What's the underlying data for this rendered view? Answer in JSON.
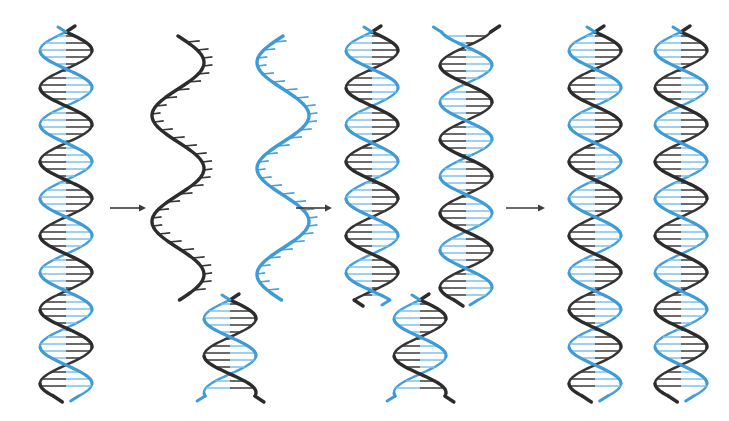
{
  "figure": {
    "background_color": "#ffffff",
    "width": 729,
    "height": 421,
    "colors": {
      "parent_strand_dark": "#2c2c2c",
      "parent_strand_blue": "#3d9bd8",
      "base_pair_dark": "#3a3a3a",
      "base_pair_blue": "#7fc0e8",
      "arrow": "#3a3a3a"
    }
  },
  "stages": [
    {
      "id": "stage-1",
      "label": "Parental DNA double helix",
      "helices": [
        {
          "id": "parent-helix",
          "label": "Parental double helix",
          "center_x": 66,
          "top_y": 32,
          "bottom_y": 396,
          "amplitude": 26,
          "period": 74,
          "phase": 0,
          "paired": true,
          "strand_a_color": "#2c2c2c",
          "strand_b_color": "#3d9bd8"
        }
      ]
    },
    {
      "id": "stage-2",
      "label": "Strands separate; template strands exposed",
      "helices": [
        {
          "id": "template-strand-dark",
          "label": "Dark template strand, unwound",
          "center_x": 178,
          "top_y": 36,
          "bottom_y": 300,
          "amplitude": 26,
          "period": 106,
          "phase": 0,
          "paired": false,
          "strand_a_color": "#2c2c2c",
          "teeth_color": "#3a3a3a",
          "teeth_side": "right"
        },
        {
          "id": "template-strand-blue",
          "label": "Blue template strand, unwound",
          "center_x": 283,
          "top_y": 36,
          "bottom_y": 300,
          "amplitude": 26,
          "period": 106,
          "phase": 3.141592653589793,
          "paired": false,
          "strand_a_color": "#3d9bd8",
          "teeth_color": "#3d9bd8",
          "teeth_side": "right"
        },
        {
          "id": "unreplicated-fork-base",
          "label": "Still-paired parental region below replication fork",
          "center_x": 230,
          "top_y": 300,
          "bottom_y": 396,
          "amplitude": 26,
          "period": 74,
          "phase": 0,
          "paired": true,
          "strand_a_color": "#2c2c2c",
          "strand_b_color": "#3d9bd8"
        }
      ]
    },
    {
      "id": "stage-3",
      "label": "New complementary strands synthesized on each template",
      "helices": [
        {
          "id": "daughter-helix-left",
          "label": "Daughter helix forming on dark template",
          "center_x": 372,
          "top_y": 32,
          "bottom_y": 300,
          "amplitude": 26,
          "period": 74,
          "phase": 0,
          "paired": true,
          "strand_a_color": "#2c2c2c",
          "strand_b_color": "#3d9bd8"
        },
        {
          "id": "daughter-helix-right",
          "label": "Daughter helix forming on blue template",
          "center_x": 466,
          "top_y": 32,
          "bottom_y": 300,
          "amplitude": 26,
          "period": 74,
          "phase": 1.9,
          "paired": true,
          "strand_a_color": "#2c2c2c",
          "strand_b_color": "#3d9bd8"
        },
        {
          "id": "replication-fork-junction",
          "label": "Replication fork junction region",
          "center_x": 420,
          "top_y": 300,
          "bottom_y": 396,
          "amplitude": 26,
          "period": 74,
          "phase": 0,
          "paired": true,
          "strand_a_color": "#2c2c2c",
          "strand_b_color": "#3d9bd8"
        }
      ]
    },
    {
      "id": "stage-4",
      "label": "Two identical daughter DNA molecules",
      "helices": [
        {
          "id": "daughter-molecule-1",
          "label": "Daughter DNA molecule 1",
          "center_x": 595,
          "top_y": 32,
          "bottom_y": 396,
          "amplitude": 26,
          "period": 74,
          "phase": 0,
          "paired": true,
          "strand_a_color": "#2c2c2c",
          "strand_b_color": "#3d9bd8"
        },
        {
          "id": "daughter-molecule-2",
          "label": "Daughter DNA molecule 2",
          "center_x": 681,
          "top_y": 32,
          "bottom_y": 396,
          "amplitude": 26,
          "period": 74,
          "phase": 0,
          "paired": true,
          "strand_a_color": "#2c2c2c",
          "strand_b_color": "#3d9bd8"
        }
      ]
    }
  ],
  "arrows": [
    {
      "id": "arrow-1",
      "label": "Proceeds to strand separation",
      "x1": 110,
      "x2": 146,
      "y": 208
    },
    {
      "id": "arrow-2",
      "label": "Proceeds to new strand synthesis",
      "x1": 296,
      "x2": 332,
      "y": 208
    },
    {
      "id": "arrow-3",
      "label": "Proceeds to two daughter molecules",
      "x1": 506,
      "x2": 545,
      "y": 208
    }
  ]
}
